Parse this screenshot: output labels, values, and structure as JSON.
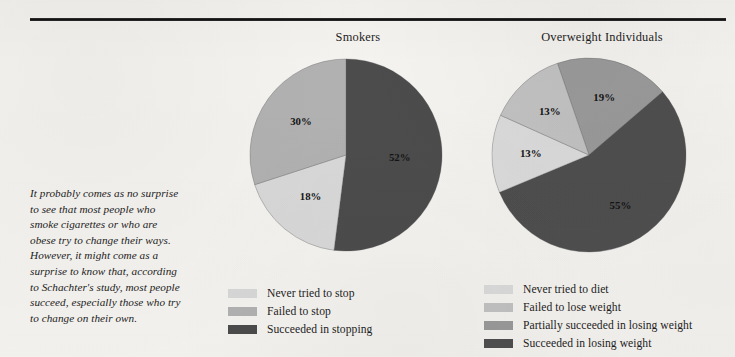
{
  "page": {
    "background_color": "#f6f4f0",
    "rule_color": "#111111"
  },
  "caption": {
    "text": "It probably comes as no surprise to see that most people who smoke cigarettes or who are obese try to change their ways. However, it might come as a surprise to know that, according to Schachter's study, most people succeed, especially those who try to change on their own."
  },
  "chart_data": [
    {
      "type": "pie",
      "id": "smokers",
      "title": "Smokers",
      "categories": [
        "Never tried to stop",
        "Failed to stop",
        "Succeeded in stopping"
      ],
      "values": [
        18,
        30,
        52
      ],
      "labels": [
        "18%",
        "30%",
        "52%"
      ],
      "colors": [
        "#d9d9d9",
        "#b2b2b2",
        "#4c4c4c"
      ],
      "legend_position": "bottom",
      "draw_order": [
        {
          "category": "Succeeded in stopping",
          "value": 52,
          "label": "52%",
          "color": "#4c4c4c",
          "start_deg": 0,
          "sweep_deg": 187.2,
          "label_r": 0.56
        },
        {
          "category": "Never tried to stop",
          "value": 18,
          "label": "18%",
          "color": "#d9d9d9",
          "start_deg": 187.2,
          "sweep_deg": 64.8,
          "label_r": 0.58
        },
        {
          "category": "Failed to stop",
          "value": 30,
          "label": "30%",
          "color": "#b2b2b2",
          "start_deg": 252.0,
          "sweep_deg": 108.0,
          "label_r": 0.58
        }
      ]
    },
    {
      "type": "pie",
      "id": "overweight",
      "title": "Overweight Individuals",
      "categories": [
        "Never tried to diet",
        "Failed to lose weight",
        "Partially succeeded in losing weight",
        "Succeeded in losing weight"
      ],
      "values": [
        13,
        13,
        19,
        55
      ],
      "labels": [
        "13%",
        "13%",
        "19%",
        "55%"
      ],
      "colors": [
        "#dcdcdc",
        "#c3c3c3",
        "#9b9b9b",
        "#4f4f4f"
      ],
      "legend_position": "bottom",
      "draw_order": [
        {
          "category": "Partially succeeded in losing weight",
          "value": 19,
          "label": "19%",
          "color": "#9b9b9b",
          "start_deg": 341.0,
          "sweep_deg": 68.4,
          "label_r": 0.6
        },
        {
          "category": "Succeeded in losing weight",
          "value": 55,
          "label": "55%",
          "color": "#4f4f4f",
          "start_deg": 49.4,
          "sweep_deg": 198.0,
          "label_r": 0.62
        },
        {
          "category": "Never tried to diet",
          "value": 13,
          "label": "13%",
          "color": "#dcdcdc",
          "start_deg": 247.4,
          "sweep_deg": 46.8,
          "label_r": 0.6
        },
        {
          "category": "Failed to lose weight",
          "value": 13,
          "label": "13%",
          "color": "#c3c3c3",
          "start_deg": 294.2,
          "sweep_deg": 46.8,
          "label_r": 0.6
        }
      ]
    }
  ],
  "legends": {
    "smokers": [
      {
        "label": "Never tried to stop",
        "color": "#d9d9d9"
      },
      {
        "label": "Failed to stop",
        "color": "#b2b2b2"
      },
      {
        "label": "Succeeded in stopping",
        "color": "#4c4c4c"
      }
    ],
    "overweight": [
      {
        "label": "Never tried to diet",
        "color": "#dcdcdc"
      },
      {
        "label": "Failed to lose weight",
        "color": "#c3c3c3"
      },
      {
        "label": "Partially succeeded in losing weight",
        "color": "#9b9b9b"
      },
      {
        "label": "Succeeded in losing weight",
        "color": "#4f4f4f"
      }
    ]
  }
}
